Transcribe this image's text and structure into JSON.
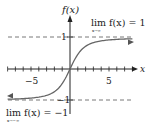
{
  "chart_data": {
    "type": "line",
    "title": "",
    "ylabel": "f(x)",
    "xlabel": "x",
    "xlim": [
      -9,
      9
    ],
    "ylim": [
      -1.7,
      1.7
    ],
    "xticks": [
      -8,
      -7,
      -6,
      -5,
      -4,
      -3,
      -2,
      -1,
      1,
      2,
      3,
      4,
      5,
      6,
      7,
      8
    ],
    "xtick_labels": {
      "neg": "−5",
      "pos": "5"
    },
    "yticks_labels": {
      "top": "1",
      "bottom": "−1"
    },
    "asymptotes": [
      1,
      -1
    ],
    "series": [
      {
        "name": "f(x)",
        "function": "sigmoid-like odd function",
        "x": [
          -8,
          -6,
          -4,
          -2,
          -1,
          0,
          1,
          2,
          4,
          6,
          8
        ],
        "values": [
          -0.83,
          -0.76,
          -0.64,
          -0.45,
          -0.3,
          0,
          0.3,
          0.45,
          0.64,
          0.76,
          0.83
        ]
      }
    ],
    "annotations": [
      {
        "text_main": "lim f(x) = 1",
        "subscript": "x→∞",
        "position": "top-right"
      },
      {
        "text_main": "lim f(x) = −1",
        "subscript": "x→−∞",
        "position": "bottom-left"
      }
    ],
    "grid": false
  },
  "labels": {
    "ylabel": "f(x)",
    "xlabel": "x",
    "xneg": "−5",
    "xpos": "5",
    "ytop": "1",
    "ybot": "−1",
    "lim_top": "lim f(x) = 1",
    "lim_top_sub": "x→∞",
    "lim_bot": "lim f(x) = −1",
    "lim_bot_sub": "x→−∞"
  }
}
